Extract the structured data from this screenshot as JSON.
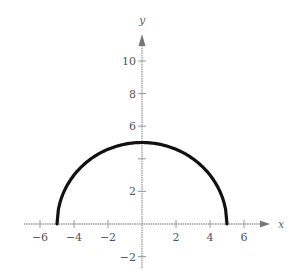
{
  "chart_data": {
    "type": "line",
    "title": "",
    "xlabel": "x",
    "ylabel": "y",
    "xlim": [
      -6.5,
      7.5
    ],
    "ylim": [
      -2.5,
      11.5
    ],
    "grid": false,
    "legend": null,
    "x_ticks": [
      -6,
      -4,
      -2,
      2,
      4,
      6
    ],
    "x_tick_labels": [
      "-6",
      "-4",
      "-2",
      "2",
      "4",
      "6"
    ],
    "y_ticks": [
      -2,
      2,
      4,
      6,
      8,
      10
    ],
    "y_tick_labels": [
      "-2",
      "2",
      "",
      "6",
      "8",
      "10"
    ],
    "series": [
      {
        "name": "y = sqrt(25 - x^2)",
        "description": "Upper semicircle of radius 5 centered at origin",
        "x": [
          -5,
          -4,
          -3,
          -2,
          -1,
          0,
          1,
          2,
          3,
          4,
          5
        ],
        "y": [
          0,
          3,
          4,
          4.58,
          4.9,
          5,
          4.9,
          4.58,
          4,
          3,
          0
        ],
        "color": "#111111"
      }
    ]
  },
  "style": {
    "axis_color": "#9a9a9a",
    "curve_color": "#111111",
    "label_color": "#555555"
  }
}
